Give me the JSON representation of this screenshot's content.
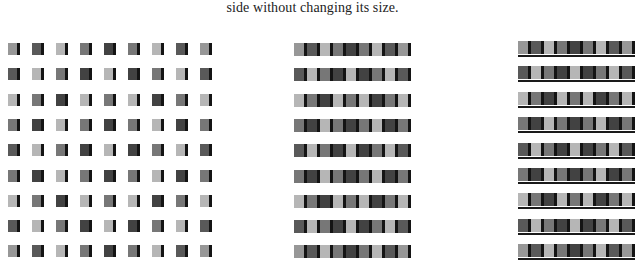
{
  "caption": "side without changing its size.",
  "palette": {
    "G": "#979797",
    "L": "#b6b6b6",
    "M": "#777777",
    "D": "#595959",
    "K": "#424242",
    "edge": "#141414"
  },
  "grid": [
    [
      "G",
      "D",
      "L",
      "M",
      "K",
      "M",
      "L",
      "D",
      "G"
    ],
    [
      "D",
      "L",
      "M",
      "K",
      "L",
      "K",
      "M",
      "L",
      "D"
    ],
    [
      "L",
      "M",
      "K",
      "L",
      "M",
      "L",
      "K",
      "M",
      "L"
    ],
    [
      "M",
      "K",
      "L",
      "M",
      "K",
      "M",
      "L",
      "K",
      "M"
    ],
    [
      "D",
      "L",
      "M",
      "K",
      "L",
      "K",
      "M",
      "L",
      "D"
    ],
    [
      "M",
      "K",
      "L",
      "M",
      "K",
      "M",
      "L",
      "K",
      "M"
    ],
    [
      "L",
      "M",
      "K",
      "L",
      "M",
      "L",
      "K",
      "M",
      "L"
    ],
    [
      "D",
      "L",
      "M",
      "K",
      "L",
      "K",
      "M",
      "L",
      "D"
    ],
    [
      "G",
      "D",
      "L",
      "M",
      "K",
      "M",
      "L",
      "D",
      "G"
    ]
  ],
  "panels": [
    {
      "id": "panel-left",
      "name": "separated-squares",
      "col_pitch": 24,
      "row_pitch": 25.3
    },
    {
      "id": "panel-middle",
      "name": "packed-bars",
      "col_pitch": 13,
      "row_pitch": 25.3
    },
    {
      "id": "panel-right",
      "name": "packed-bars-with-baseline",
      "col_pitch": 13,
      "row_pitch": 25.4
    }
  ]
}
